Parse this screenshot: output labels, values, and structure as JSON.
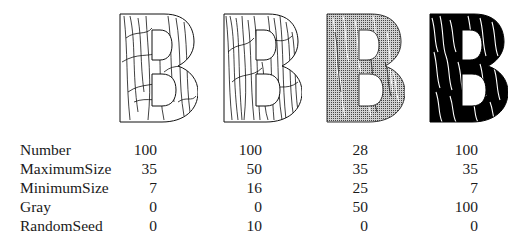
{
  "figure": {
    "letter": "B",
    "variants": [
      {
        "name": "column-1",
        "fill": "white",
        "stroke_color": "#000000",
        "style": "line-grass"
      },
      {
        "name": "column-2",
        "fill": "white",
        "stroke_color": "#000000",
        "style": "dense-line-grass"
      },
      {
        "name": "column-3",
        "fill": "#b5b5b5",
        "stroke_color": "#ffffff",
        "style": "gray-grass"
      },
      {
        "name": "column-4",
        "fill": "#000000",
        "stroke_color": "#ffffff",
        "style": "black-grass"
      }
    ]
  },
  "table": {
    "rows": [
      {
        "label": "Number",
        "values": [
          "100",
          "100",
          "28",
          "100"
        ]
      },
      {
        "label": "MaximumSize",
        "values": [
          "35",
          "50",
          "35",
          "35"
        ]
      },
      {
        "label": "MinimumSize",
        "values": [
          "7",
          "16",
          "25",
          "7"
        ]
      },
      {
        "label": "Gray",
        "values": [
          "0",
          "0",
          "50",
          "100"
        ]
      },
      {
        "label": "RandomSeed",
        "values": [
          "0",
          "10",
          "0",
          "0"
        ]
      }
    ]
  }
}
